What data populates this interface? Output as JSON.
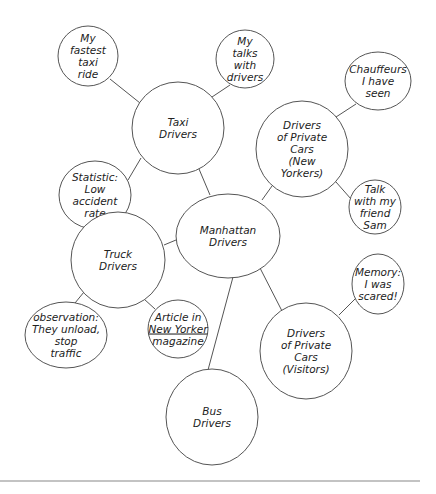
{
  "diagram": {
    "type": "cluster-map",
    "nodes": [
      {
        "id": "manhattan",
        "lines": [
          "Manhattan",
          "Drivers"
        ],
        "cx": 228,
        "cy": 236,
        "rx": 52,
        "ry": 42
      },
      {
        "id": "taxi",
        "lines": [
          "Taxi",
          "Drivers"
        ],
        "cx": 178,
        "cy": 128,
        "rx": 46,
        "ry": 46
      },
      {
        "id": "fastest",
        "lines": [
          "My",
          "fastest",
          "taxi",
          "ride"
        ],
        "cx": 88,
        "cy": 56,
        "rx": 30,
        "ry": 30
      },
      {
        "id": "talks",
        "lines": [
          "My",
          "talks",
          "with",
          "drivers"
        ],
        "cx": 245,
        "cy": 59,
        "rx": 29,
        "ry": 29
      },
      {
        "id": "statistic",
        "lines": [
          "Statistic:",
          "Low",
          "accident",
          "rate"
        ],
        "cx": 95,
        "cy": 195,
        "rx": 36,
        "ry": 34
      },
      {
        "id": "private_ny",
        "lines": [
          "Drivers",
          "of Private",
          "Cars",
          "(New",
          "Yorkers)"
        ],
        "cx": 302,
        "cy": 149,
        "rx": 46,
        "ry": 48
      },
      {
        "id": "chauffeurs",
        "lines": [
          "Chauffeurs",
          "I have",
          "seen"
        ],
        "cx": 378,
        "cy": 81,
        "rx": 33,
        "ry": 29
      },
      {
        "id": "sam",
        "lines": [
          "Talk",
          "with my",
          "friend",
          "Sam"
        ],
        "cx": 375,
        "cy": 207,
        "rx": 26,
        "ry": 27
      },
      {
        "id": "truck",
        "lines": [
          "Truck",
          "Drivers"
        ],
        "cx": 118,
        "cy": 260,
        "rx": 47,
        "ry": 48
      },
      {
        "id": "observation",
        "lines": [
          "observation:",
          "They unload,",
          "stop",
          "traffic"
        ],
        "cx": 66,
        "cy": 335,
        "rx": 41,
        "ry": 33
      },
      {
        "id": "article",
        "lines": [
          "Article in",
          "New Yorker",
          "magazine"
        ],
        "underline_line": 1,
        "cx": 178,
        "cy": 329,
        "rx": 30,
        "ry": 29
      },
      {
        "id": "memory",
        "lines": [
          "Memory:",
          "I was",
          "scared!"
        ],
        "cx": 378,
        "cy": 284,
        "rx": 26,
        "ry": 30
      },
      {
        "id": "private_visitors",
        "lines": [
          "Drivers",
          "of Private",
          "Cars",
          "(Visitors)"
        ],
        "cx": 306,
        "cy": 351,
        "rx": 46,
        "ry": 48
      },
      {
        "id": "bus",
        "lines": [
          "Bus",
          "Drivers"
        ],
        "cx": 212,
        "cy": 417,
        "rx": 46,
        "ry": 48
      }
    ],
    "edges": [
      {
        "from": "manhattan",
        "to": "taxi",
        "x1": 210,
        "y1": 195,
        "x2": 199,
        "y2": 169
      },
      {
        "from": "manhattan",
        "to": "private_ny",
        "x1": 262,
        "y1": 200,
        "x2": 272,
        "y2": 186
      },
      {
        "from": "manhattan",
        "to": "truck",
        "x1": 176,
        "y1": 240,
        "x2": 164,
        "y2": 245
      },
      {
        "from": "manhattan",
        "to": "bus",
        "x1": 233,
        "y1": 277,
        "x2": 208,
        "y2": 370
      },
      {
        "from": "manhattan",
        "to": "private_visitors",
        "x1": 260,
        "y1": 268,
        "x2": 282,
        "y2": 311
      },
      {
        "from": "taxi",
        "to": "fastest",
        "x1": 110,
        "y1": 79,
        "x2": 140,
        "y2": 103
      },
      {
        "from": "taxi",
        "to": "talks",
        "x1": 212,
        "y1": 97,
        "x2": 230,
        "y2": 85
      },
      {
        "from": "taxi",
        "to": "statistic",
        "x1": 128,
        "y1": 180,
        "x2": 141,
        "y2": 158
      },
      {
        "from": "private_ny",
        "to": "chauffeurs",
        "x1": 336,
        "y1": 117,
        "x2": 356,
        "y2": 104
      },
      {
        "from": "private_ny",
        "to": "sam",
        "x1": 336,
        "y1": 182,
        "x2": 351,
        "y2": 199
      },
      {
        "from": "truck",
        "to": "observation",
        "x1": 75,
        "y1": 303,
        "x2": 84,
        "y2": 292
      },
      {
        "from": "truck",
        "to": "article",
        "x1": 144,
        "y1": 299,
        "x2": 155,
        "y2": 309
      },
      {
        "from": "private_visitors",
        "to": "memory",
        "x1": 339,
        "y1": 315,
        "x2": 356,
        "y2": 298
      }
    ]
  },
  "footer_rule": {
    "x1": 0,
    "y1": 481,
    "x2": 420,
    "y2": 481
  }
}
